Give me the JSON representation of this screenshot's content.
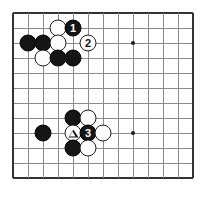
{
  "figure": {
    "kind": "go-board-diagram",
    "board": {
      "columns": 13,
      "rows": 12,
      "cell_size": 15,
      "origin_x": 13,
      "origin_y": 13,
      "line_color": "#8a8a8a",
      "edge_color": "#333333",
      "background": "#ffffff"
    },
    "star_points": [
      {
        "name": "star-point-upper-right",
        "col": 8,
        "row": 2
      },
      {
        "name": "star-point-lower-right",
        "col": 8,
        "row": 8
      }
    ],
    "stones": [
      {
        "name": "white-stone-c2",
        "color": "white",
        "col": 3,
        "row": 1,
        "label": "",
        "mark": ""
      },
      {
        "name": "black-stone-move-1",
        "color": "black",
        "col": 4,
        "row": 1,
        "label": "1",
        "mark": ""
      },
      {
        "name": "black-stone-a3",
        "color": "black",
        "col": 1,
        "row": 2,
        "label": "",
        "mark": ""
      },
      {
        "name": "black-stone-b3",
        "color": "black",
        "col": 2,
        "row": 2,
        "label": "",
        "mark": ""
      },
      {
        "name": "white-stone-c3",
        "color": "white",
        "col": 3,
        "row": 2,
        "label": "",
        "mark": ""
      },
      {
        "name": "white-stone-move-2",
        "color": "white",
        "col": 5,
        "row": 2,
        "label": "2",
        "mark": ""
      },
      {
        "name": "white-stone-b4",
        "color": "white",
        "col": 2,
        "row": 3,
        "label": "",
        "mark": ""
      },
      {
        "name": "black-stone-c4",
        "color": "black",
        "col": 3,
        "row": 3,
        "label": "",
        "mark": ""
      },
      {
        "name": "black-stone-d4",
        "color": "black",
        "col": 4,
        "row": 3,
        "label": "",
        "mark": ""
      },
      {
        "name": "black-stone-d8",
        "color": "black",
        "col": 4,
        "row": 7,
        "label": "",
        "mark": ""
      },
      {
        "name": "white-stone-e8",
        "color": "white",
        "col": 5,
        "row": 7,
        "label": "",
        "mark": ""
      },
      {
        "name": "black-stone-b9",
        "color": "black",
        "col": 2,
        "row": 8,
        "label": "",
        "mark": ""
      },
      {
        "name": "white-stone-triangle",
        "color": "white",
        "col": 4,
        "row": 8,
        "label": "",
        "mark": "triangle"
      },
      {
        "name": "black-stone-move-3",
        "color": "black",
        "col": 5,
        "row": 8,
        "label": "3",
        "mark": ""
      },
      {
        "name": "white-stone-f9",
        "color": "white",
        "col": 6,
        "row": 8,
        "label": "",
        "mark": ""
      },
      {
        "name": "black-stone-d10",
        "color": "black",
        "col": 4,
        "row": 9,
        "label": "",
        "mark": ""
      },
      {
        "name": "white-stone-e10",
        "color": "white",
        "col": 5,
        "row": 9,
        "label": "",
        "mark": ""
      }
    ],
    "move_labels": [
      "1",
      "2",
      "3"
    ],
    "marks": [
      "triangle"
    ]
  }
}
